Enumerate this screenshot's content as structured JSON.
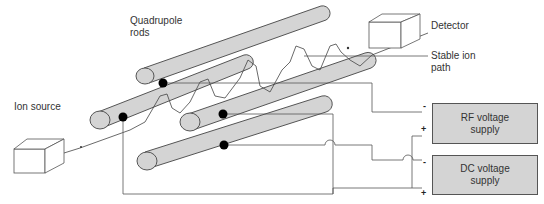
{
  "diagram": {
    "labels": {
      "quadrupole_rods": "Quadrupole\nrods",
      "ion_source": "Ion source",
      "detector": "Detector",
      "stable_ion_path": "Stable ion\npath"
    },
    "supplies": [
      {
        "name": "RF voltage\nsupply",
        "minus": "-",
        "plus": "+"
      },
      {
        "name": "DC voltage\nsupply",
        "minus": "-",
        "plus": "+"
      }
    ],
    "colors": {
      "rod_fill": "#d4d4d4",
      "line": "#555555",
      "dot": "#000000"
    }
  }
}
